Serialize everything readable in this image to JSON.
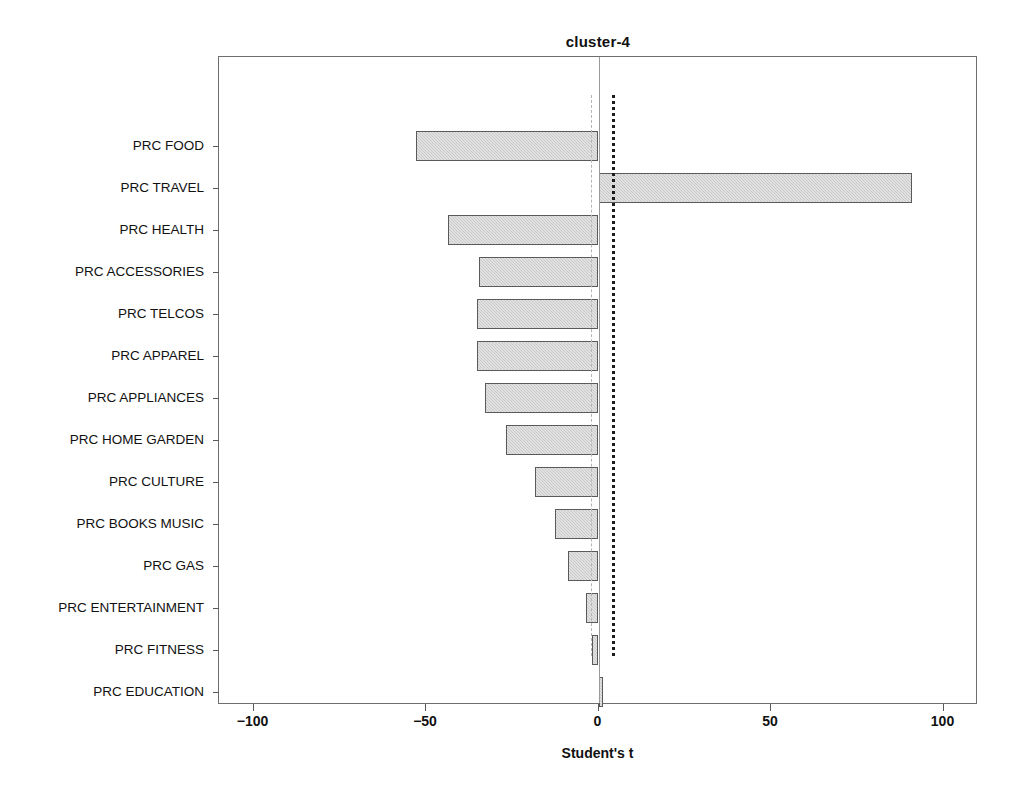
{
  "chart_data": {
    "type": "bar",
    "orientation": "horizontal",
    "title": "cluster-4",
    "xlabel": "Student's t",
    "ylabel": "",
    "xlim": [
      -110,
      110
    ],
    "xticks": [
      -100,
      -50,
      0,
      50,
      100
    ],
    "xtick_labels": [
      "−100",
      "−50",
      "0",
      "50",
      "100"
    ],
    "grid": false,
    "legend": null,
    "categories": [
      "PRC FOOD",
      "PRC TRAVEL",
      "PRC HEALTH",
      "PRC ACCESSORIES",
      "PRC TELCOS",
      "PRC APPAREL",
      "PRC APPLIANCES",
      "PRC HOME GARDEN",
      "PRC CULTURE",
      "PRC BOOKS MUSIC",
      "PRC GAS",
      "PRC ENTERTAINMENT",
      "PRC FITNESS",
      "PRC EDUCATION"
    ],
    "values": [
      -52.8,
      90.8,
      -43.5,
      -34.6,
      -35.2,
      -35.2,
      -33.0,
      -26.9,
      -18.3,
      -12.7,
      -8.9,
      -3.6,
      -2.0,
      1.4
    ],
    "reference_lines": [
      {
        "name": "lower-critical-t",
        "value": -2.2,
        "style": "dashed",
        "color": "#b5b5b5"
      },
      {
        "name": "upper-critical-t",
        "value": 3.9,
        "style": "dotted",
        "color": "#1c1c1c"
      }
    ],
    "zero_line": {
      "value": 0,
      "style": "solid",
      "color": "#9a9a9a"
    },
    "bar_style": {
      "fill": "#c9c9c9",
      "edge": "#5a5a5a",
      "hatch": "crosshatch"
    }
  }
}
